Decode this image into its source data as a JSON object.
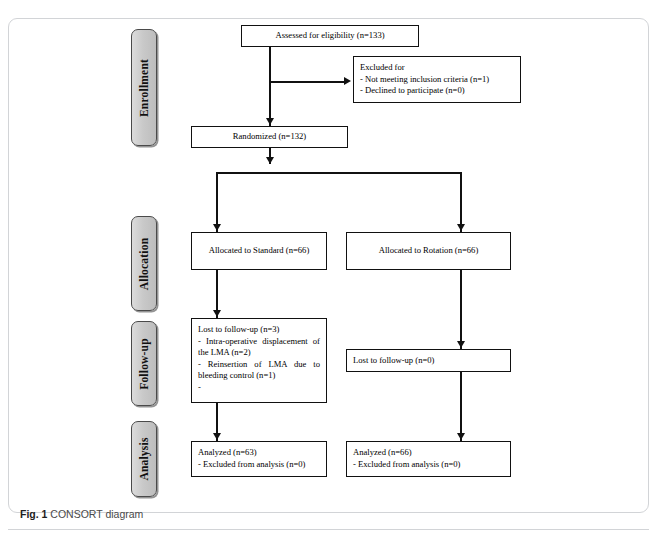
{
  "figure": {
    "caption_label": "Fig. 1",
    "caption_text": "CONSORT diagram",
    "top_bleed_text": " "
  },
  "stages": [
    {
      "id": "enrollment",
      "label": "Enrollment"
    },
    {
      "id": "allocation",
      "label": "Allocation"
    },
    {
      "id": "followup",
      "label": "Follow-up"
    },
    {
      "id": "analysis",
      "label": "Analysis"
    }
  ],
  "boxes": {
    "assessed": {
      "line1": "Assessed for eligibility (n=133)"
    },
    "excluded": {
      "line1": "Excluded for",
      "line2": "- Not meeting inclusion criteria (n=1)",
      "line3": "- Declined to participate (n=0)"
    },
    "randomized": {
      "line1": "Randomized (n=132)"
    },
    "alloc_left": {
      "line1": "Allocated to Standard (n=66)"
    },
    "alloc_right": {
      "line1": "Allocated to Rotation (n=66)"
    },
    "lost_left": {
      "line1": "Lost to follow-up (n=3)",
      "line2": "- Intra-operative displacement of the LMA (n=2)",
      "line3": "- Reinsertion of LMA due to bleeding control (n=1)",
      "line4": "-"
    },
    "lost_right": {
      "line1": "Lost to follow-up (n=0)"
    },
    "analyzed_left": {
      "line1": "Analyzed (n=63)",
      "line2": "- Excluded from analysis (n=0)"
    },
    "analyzed_right": {
      "line1": "Analyzed (n=66)",
      "line2": "- Excluded from analysis (n=0)"
    }
  },
  "colors": {
    "stage_fill": "#c9c9c9",
    "box_border": "#111111",
    "card_border": "#d2d4d7",
    "connector": "#111111"
  }
}
